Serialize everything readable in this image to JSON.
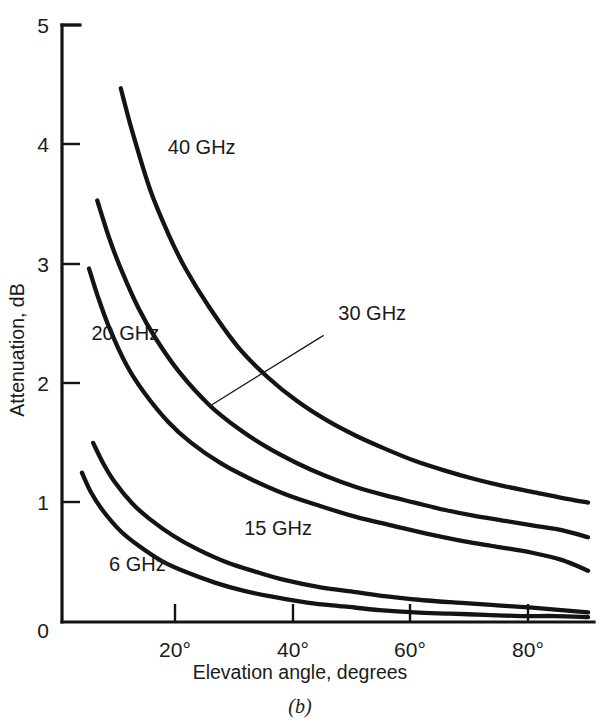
{
  "figure": {
    "caption": "(b)",
    "y_axis_title": "Attenuation, dB",
    "x_axis_title": "Elevation angle, degrees",
    "y_ticks": [
      "0",
      "1",
      "2",
      "3",
      "4",
      "5"
    ],
    "x_ticks": [
      "20°",
      "40°",
      "60°",
      "80°"
    ],
    "series_labels": {
      "s40": "40 GHz",
      "s30": "30 GHz",
      "s20": "20 GHz",
      "s15": "15 GHz",
      "s6": "6 GHz"
    },
    "ink_color": "#141414"
  },
  "chart_data": {
    "type": "line",
    "title": "",
    "subtitle": "",
    "caption": "(b)",
    "xlabel": "Elevation angle, degrees",
    "ylabel": "Attenuation, dB",
    "xlim": [
      0,
      90
    ],
    "ylim": [
      0,
      5
    ],
    "xticks": [
      20,
      40,
      60,
      80
    ],
    "xticklabels": [
      "20°",
      "40°",
      "60°",
      "80°"
    ],
    "yticks": [
      0,
      1,
      2,
      3,
      4,
      5
    ],
    "yticklabels": [
      "0",
      "1",
      "2",
      "3",
      "4",
      "5"
    ],
    "grid": false,
    "legend": "inline-annotations",
    "series": [
      {
        "name": "40 GHz",
        "label_position": {
          "x": 18,
          "y": 3.92
        },
        "x": [
          10,
          12,
          15,
          18,
          21,
          25,
          30,
          35,
          40,
          45,
          50,
          55,
          60,
          65,
          70,
          75,
          80,
          85,
          89.5
        ],
        "y": [
          4.47,
          4.1,
          3.62,
          3.26,
          2.96,
          2.64,
          2.3,
          2.05,
          1.85,
          1.69,
          1.56,
          1.45,
          1.35,
          1.27,
          1.2,
          1.14,
          1.09,
          1.04,
          1.0
        ]
      },
      {
        "name": "30 GHz",
        "label_position": {
          "x": 47,
          "y": 2.53
        },
        "leader_line": {
          "from": {
            "x": 44.5,
            "y": 2.4
          },
          "to": {
            "x": 25.5,
            "y": 1.82
          }
        },
        "x": [
          6,
          8,
          10,
          13,
          16,
          20,
          25,
          30,
          35,
          40,
          45,
          50,
          55,
          60,
          65,
          70,
          75,
          80,
          85,
          89.5
        ],
        "y": [
          3.53,
          3.22,
          2.96,
          2.63,
          2.37,
          2.09,
          1.82,
          1.62,
          1.46,
          1.33,
          1.22,
          1.13,
          1.06,
          1.0,
          0.94,
          0.89,
          0.85,
          0.81,
          0.77,
          0.71
        ]
      },
      {
        "name": "20 GHz",
        "label_position": {
          "x": 5,
          "y": 2.36
        },
        "x": [
          4.6,
          6,
          8,
          11,
          14,
          18,
          22,
          27,
          32,
          38,
          44,
          50,
          56,
          62,
          68,
          74,
          80,
          85,
          89.5
        ],
        "y": [
          2.96,
          2.74,
          2.47,
          2.15,
          1.92,
          1.68,
          1.5,
          1.33,
          1.2,
          1.07,
          0.97,
          0.88,
          0.81,
          0.74,
          0.68,
          0.63,
          0.58,
          0.52,
          0.43
        ]
      },
      {
        "name": "15 GHz",
        "label_position": {
          "x": 31,
          "y": 0.73
        },
        "x": [
          5.3,
          7,
          9,
          12,
          15,
          19,
          23,
          28,
          33,
          38,
          44,
          50,
          56,
          62,
          68,
          74,
          80,
          85,
          89.5
        ],
        "y": [
          1.5,
          1.33,
          1.17,
          0.99,
          0.86,
          0.72,
          0.61,
          0.5,
          0.42,
          0.35,
          0.29,
          0.25,
          0.21,
          0.18,
          0.16,
          0.14,
          0.12,
          0.1,
          0.08
        ]
      },
      {
        "name": "6 GHz",
        "label_position": {
          "x": 8,
          "y": 0.43
        },
        "x": [
          3.4,
          5,
          7,
          10,
          13,
          17,
          21,
          26,
          31,
          36,
          42,
          48,
          54,
          60,
          66,
          72,
          78,
          84,
          89.5
        ],
        "y": [
          1.25,
          1.08,
          0.93,
          0.76,
          0.64,
          0.51,
          0.42,
          0.33,
          0.26,
          0.21,
          0.16,
          0.13,
          0.1,
          0.08,
          0.07,
          0.06,
          0.05,
          0.05,
          0.04
        ]
      }
    ]
  }
}
